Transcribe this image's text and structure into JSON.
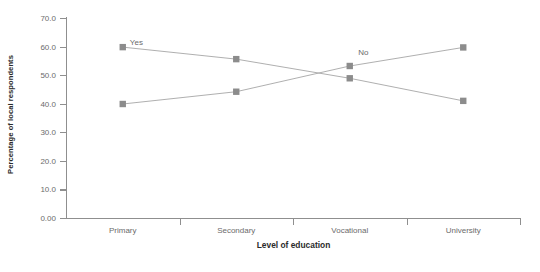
{
  "chart_data": {
    "type": "line",
    "title": "",
    "subtitle": "",
    "xlabel": "Level of education",
    "ylabel": "Percentage of local respondents",
    "categories": [
      "Primary",
      "Secondary",
      "Vocational",
      "University"
    ],
    "series": [
      {
        "name": "Yes",
        "values": [
          59.8,
          55.6,
          48.9,
          41.0
        ],
        "color": "#8c8c8c"
      },
      {
        "name": "No",
        "values": [
          39.9,
          44.2,
          53.2,
          59.7
        ],
        "color": "#8c8c8c"
      }
    ],
    "ylim": [
      0,
      70
    ],
    "xlim": [
      0,
      4
    ],
    "yticks": [
      0,
      10,
      20,
      30,
      40,
      50,
      60,
      70
    ],
    "ytick_labels": [
      "0.00",
      "10.0",
      "20.0",
      "30.0",
      "40.0",
      "50.0",
      "60.0",
      "70.0"
    ],
    "grid": false,
    "legend": "inline-annotations",
    "annotations": [
      {
        "text": "Yes",
        "series": "Yes",
        "x_value": 0.62,
        "y_value": 61.5
      },
      {
        "text": "No",
        "series": "No",
        "x_value": 2.62,
        "y_value": 58.0
      }
    ],
    "marker": "square",
    "marker_color": "#8c8c8c",
    "line_color": "#a6a6a6",
    "axis_color": "#8f8f8f",
    "background": "#ffffff"
  }
}
